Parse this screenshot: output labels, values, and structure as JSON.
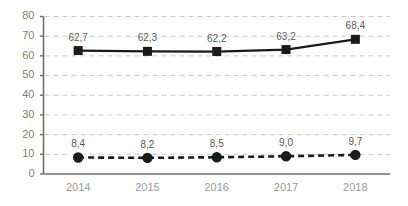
{
  "chart_data": {
    "type": "line",
    "title": "",
    "subtitle": "",
    "xlabel": "",
    "ylabel": "",
    "categories": [
      "2014",
      "2015",
      "2016",
      "2017",
      "2018"
    ],
    "ylim": [
      0,
      80
    ],
    "y_ticks": [
      "0",
      "10",
      "20",
      "30",
      "40",
      "50",
      "60",
      "70",
      "80"
    ],
    "y_tick_values": [
      0,
      10,
      20,
      30,
      40,
      50,
      60,
      70,
      80
    ],
    "grid": "horizontal-dashed",
    "legend": "none",
    "decimal_separator": ",",
    "series": [
      {
        "name": "series-1",
        "marker": "square",
        "line_style": "solid",
        "color": "#1a1a1a",
        "values": [
          62.7,
          62.3,
          62.2,
          63.2,
          68.4
        ],
        "labels": [
          "62,7",
          "62,3",
          "62,2",
          "63,2",
          "68,4"
        ]
      },
      {
        "name": "series-2",
        "marker": "circle",
        "line_style": "dashed",
        "color": "#1a1a1a",
        "values": [
          8.4,
          8.2,
          8.5,
          9.0,
          9.7
        ],
        "labels": [
          "8,4",
          "8,2",
          "8,5",
          "9,0",
          "9,7"
        ]
      }
    ]
  },
  "colors": {
    "background": "#ffffff",
    "axis": "#6f6f6f",
    "grid": "#c9c9c9",
    "data": "#1a1a1a",
    "y_tick_text": "#808080",
    "x_tick_text": "#9a9a9a",
    "point_label_text": "#5a5a5a"
  }
}
